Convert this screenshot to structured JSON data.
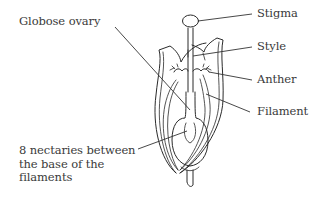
{
  "diagram": {
    "labels": {
      "globose_ovary": "Globose ovary",
      "stigma": "Stigma",
      "style": "Style",
      "anther": "Anther",
      "filament": "Filament",
      "nectaries_line1": "8 nectaries between",
      "nectaries_line2": "the base of the",
      "nectaries_line3": "filaments"
    },
    "colors": {
      "line": "#2a2a2a",
      "text": "#3a3a3a",
      "background": "#ffffff"
    }
  }
}
